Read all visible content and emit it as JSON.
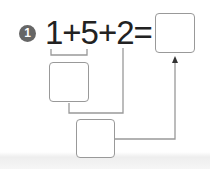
{
  "problem": {
    "number": "1",
    "expression": "1+5+2=",
    "operands": [
      "1",
      "5",
      "2"
    ],
    "operators": [
      "+",
      "+",
      "="
    ]
  },
  "boxes": {
    "answer": "",
    "step1": "",
    "step2": ""
  },
  "colors": {
    "line": "#999999",
    "circle": "#666666",
    "text": "#222222"
  }
}
